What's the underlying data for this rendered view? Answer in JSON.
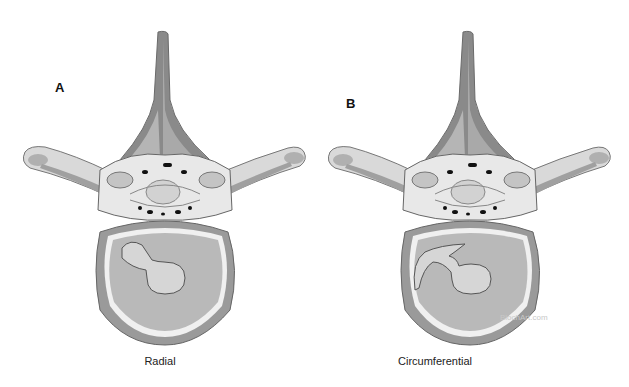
{
  "figure": {
    "panels": [
      {
        "letter": "A",
        "caption": "Radial",
        "tear_type": "radial"
      },
      {
        "letter": "B",
        "caption": "Circumferential",
        "tear_type": "circumferential"
      }
    ],
    "watermark": "BlochArt.com",
    "colors": {
      "background": "#ffffff",
      "bone_dark": "#8a8a8a",
      "bone_mid": "#a9a9a9",
      "bone_light": "#d6d6d6",
      "cortex_white": "#eeeeee",
      "disc_fill": "#b8b8b8",
      "nucleus_fill": "#d4d4d4",
      "outline": "#5a5a5a",
      "foramen_black": "#111111"
    }
  }
}
